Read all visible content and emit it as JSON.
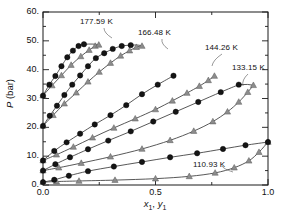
{
  "chart_data": {
    "type": "line",
    "title": "",
    "xlabel": "x1, y1",
    "ylabel": "P (bar)",
    "xlim": [
      0.0,
      1.0
    ],
    "ylim": [
      0.0,
      60.0
    ],
    "xticks": [
      "0.0",
      "0.5",
      "1.0"
    ],
    "yticks": [
      "0.",
      "10.",
      "20.",
      "30.",
      "40.",
      "50.",
      "60."
    ],
    "xtick_values": [
      0.0,
      0.5,
      1.0
    ],
    "ytick_values": [
      0,
      10,
      20,
      30,
      40,
      50,
      60
    ],
    "y_minor_interval": 5,
    "grid": false,
    "legend": "none",
    "marker_liquid": "filled-circle-black",
    "marker_vapor": "gray-triangle",
    "annotations": [
      {
        "label": "177.59 K",
        "x_px": 80,
        "y_px": 17
      },
      {
        "label": "166.48 K",
        "x_px": 138,
        "y_px": 28
      },
      {
        "label": "144.26 K",
        "x_px": 205,
        "y_px": 43
      },
      {
        "label": "133.15 K",
        "x_px": 232,
        "y_px": 63
      },
      {
        "label": "110.93 K",
        "x_px": 193,
        "y_px": 160
      }
    ],
    "series": [
      {
        "name": "177.59 K",
        "temperature_K": 177.59,
        "bubble_x": [
          0.0,
          0.028,
          0.055,
          0.082,
          0.108,
          0.133,
          0.158,
          0.182
        ],
        "bubble_P": [
          31.0,
          34.8,
          37.8,
          41.2,
          44.3,
          46.6,
          48.2,
          48.8
        ],
        "dew_x": [
          0.0,
          0.04,
          0.082,
          0.125,
          0.168,
          0.205,
          0.232,
          0.248
        ],
        "dew_P": [
          31.0,
          34.5,
          38.0,
          41.6,
          44.6,
          46.8,
          48.2,
          48.6
        ]
      },
      {
        "name": "166.48 K",
        "temperature_K": 166.48,
        "bubble_x": [
          0.0,
          0.03,
          0.062,
          0.095,
          0.13,
          0.165,
          0.2,
          0.235,
          0.272,
          0.31,
          0.35,
          0.39
        ],
        "bubble_P": [
          20.5,
          24.0,
          27.5,
          31.2,
          34.8,
          38.0,
          41.2,
          44.0,
          45.7,
          47.2,
          48.2,
          48.5
        ],
        "dew_x": [
          0.0,
          0.045,
          0.095,
          0.148,
          0.2,
          0.25,
          0.3,
          0.345,
          0.385,
          0.415,
          0.44
        ],
        "dew_P": [
          20.5,
          24.2,
          28.2,
          32.0,
          35.8,
          39.2,
          42.3,
          44.8,
          46.6,
          47.8,
          48.2
        ]
      },
      {
        "name": "144.26 K",
        "temperature_K": 144.26,
        "bubble_x": [
          0.0,
          0.05,
          0.105,
          0.165,
          0.23,
          0.3,
          0.37,
          0.44,
          0.51,
          0.58
        ],
        "bubble_P": [
          8.5,
          11.8,
          14.8,
          17.8,
          21.0,
          24.2,
          27.7,
          31.5,
          34.8,
          37.9
        ],
        "dew_x": [
          0.0,
          0.06,
          0.135,
          0.22,
          0.315,
          0.41,
          0.5,
          0.575,
          0.64,
          0.695,
          0.735,
          0.762
        ],
        "dew_P": [
          8.5,
          10.5,
          13.2,
          16.4,
          19.8,
          23.0,
          26.2,
          29.2,
          31.9,
          34.3,
          36.3,
          37.8
        ]
      },
      {
        "name": "133.15 K",
        "temperature_K": 133.15,
        "bubble_x": [
          0.0,
          0.055,
          0.12,
          0.2,
          0.29,
          0.39,
          0.49,
          0.59,
          0.69,
          0.79,
          0.87
        ],
        "bubble_P": [
          5.0,
          7.2,
          9.6,
          12.4,
          15.4,
          18.6,
          22.0,
          25.4,
          28.8,
          32.2,
          34.8
        ],
        "dew_x": [
          0.0,
          0.07,
          0.17,
          0.3,
          0.44,
          0.565,
          0.67,
          0.755,
          0.82,
          0.87,
          0.91,
          0.935
        ],
        "dew_P": [
          5.0,
          6.0,
          7.6,
          9.8,
          12.5,
          15.5,
          18.7,
          22.0,
          25.4,
          28.8,
          32.2,
          34.6
        ]
      },
      {
        "name": "110.93 K",
        "temperature_K": 110.93,
        "bubble_x": [
          0.0,
          0.05,
          0.115,
          0.2,
          0.315,
          0.44,
          0.565,
          0.685,
          0.8,
          0.9,
          1.0
        ],
        "bubble_P": [
          1.0,
          1.8,
          3.2,
          4.8,
          6.4,
          8.0,
          9.6,
          11.0,
          12.5,
          13.8,
          14.9
        ],
        "dew_x": [
          0.0,
          0.06,
          0.16,
          0.32,
          0.5,
          0.65,
          0.765,
          0.85,
          0.915,
          0.96,
          1.0
        ],
        "dew_P": [
          1.0,
          1.2,
          1.4,
          1.7,
          2.2,
          3.0,
          4.2,
          6.0,
          8.4,
          11.4,
          14.9
        ]
      }
    ]
  },
  "axis": {
    "ylabel_pre": "P",
    "ylabel_post": " (bar)",
    "xlabel_x": "x",
    "xlabel_xsub": "1",
    "xlabel_sep": ", ",
    "xlabel_y": "y",
    "xlabel_ysub": "1"
  },
  "style": {
    "curve_color": "#3a3a3a",
    "circle_color": "#151515",
    "triangle_color": "#8c8c8c",
    "triangle_edge": "#5a5a5a",
    "frame_color": "#1a1a1a",
    "background": "#ffffff"
  }
}
